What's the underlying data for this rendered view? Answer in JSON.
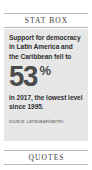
{
  "sections": {
    "stat_box": {
      "header": "STAT BOX",
      "intro": "Support for democracy in Latin America and the Caribbean fell to",
      "value": "53",
      "unit": "%",
      "outro": "in 2017, the lowest level since 1995.",
      "source": "SOURCE: Latinobarómetro"
    },
    "quotes": {
      "header": "QUOTES"
    }
  },
  "colors": {
    "page_background": "#ffffff",
    "card_background": "#e7e7e7",
    "rule": "#b9b9b9",
    "number": "#4b4b4b",
    "body_text": "#2f2f2f",
    "source_text": "#7a7a7a"
  }
}
